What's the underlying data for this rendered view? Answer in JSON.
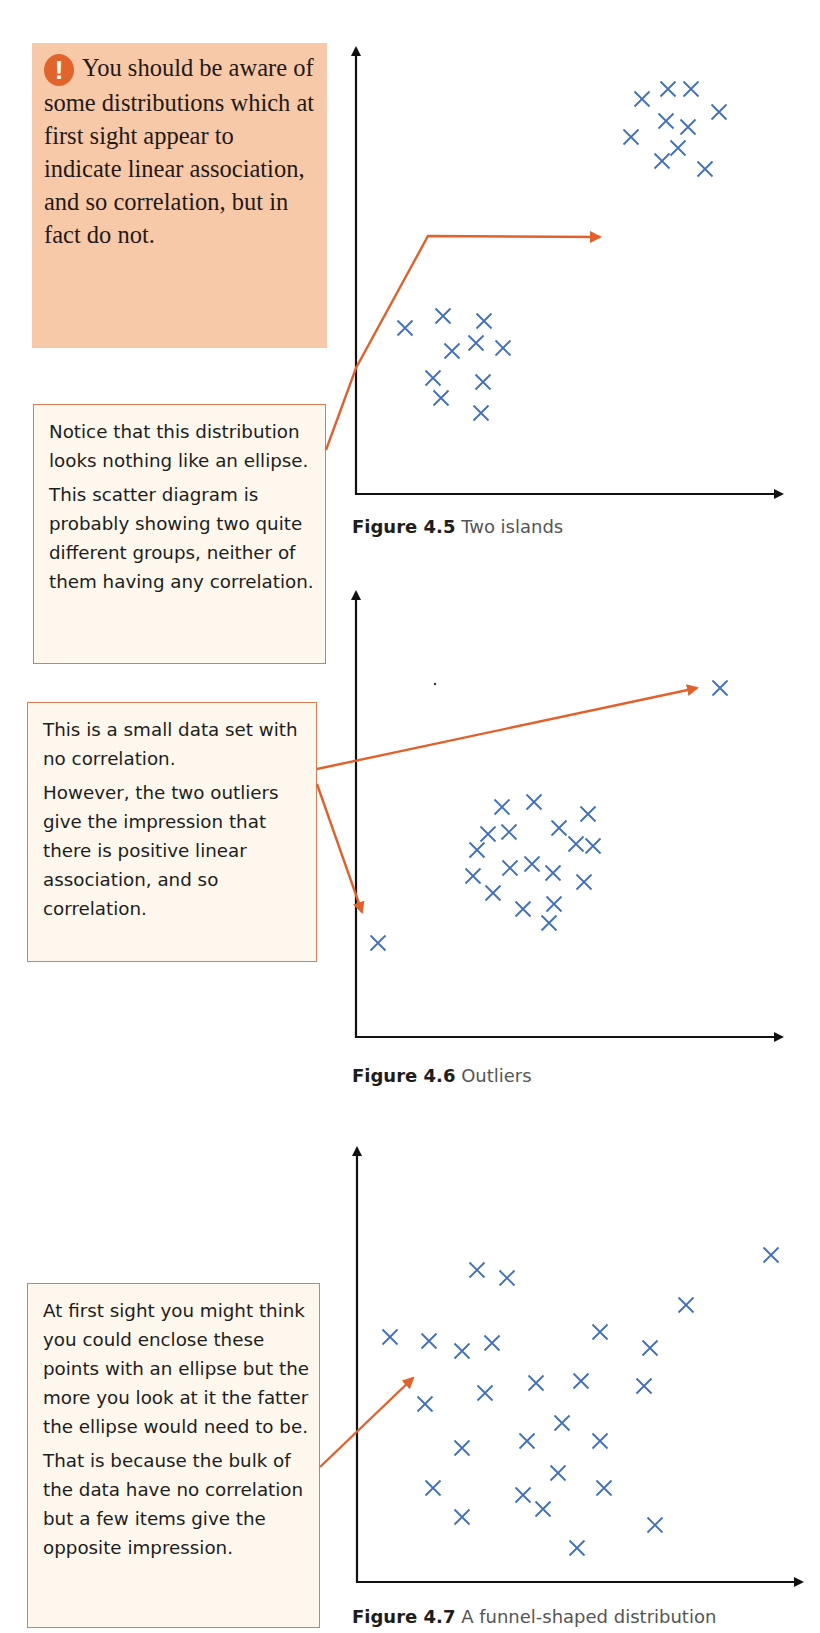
{
  "warning_box": {
    "icon": "exclamation-icon",
    "text": "You should be aware of some distributions which at first sight appear to indicate linear association, and so correlation, but in fact do not.",
    "colors": {
      "background": "#f8c9a8",
      "icon": "#e2642a"
    }
  },
  "notes": [
    {
      "paragraphs": [
        "Notice that this distribution looks nothing like an ellipse.",
        "This scatter diagram is probably showing two quite different groups, neither of them having any correlation."
      ]
    },
    {
      "paragraphs": [
        "This is a small data set with no correlation.",
        "However, the two outliers give the impression that there is positive linear association, and so correlation."
      ]
    },
    {
      "paragraphs": [
        "At first sight you might think you could enclose these points with an ellipse but the more you look at it the fatter the ellipse would need to be.",
        "That is because the bulk of the data have no correlation but a few items give the opposite impression."
      ]
    }
  ],
  "figures": [
    {
      "number": "Figure 4.5",
      "title": "Two islands"
    },
    {
      "number": "Figure 4.6",
      "title": "Outliers"
    },
    {
      "number": "Figure 4.7",
      "title": "A funnel-shaped distribution"
    }
  ],
  "colors": {
    "marker": "#3f6fc0",
    "arrow": "#e4602a",
    "axis": "#111111",
    "note_border": "#e07a4f",
    "note_bg": "#fdf7ee"
  },
  "chart_data": [
    {
      "type": "scatter",
      "title": "Figure 4.5 Two islands",
      "xlabel": "",
      "ylabel": "",
      "grid": false,
      "marker": "x",
      "series": [
        {
          "name": "lower cluster",
          "points": [
            [
              405,
              328
            ],
            [
              443,
              316
            ],
            [
              484,
              321
            ],
            [
              452,
              351
            ],
            [
              476,
              343
            ],
            [
              503,
              348
            ],
            [
              433,
              378
            ],
            [
              483,
              382
            ],
            [
              441,
              398
            ],
            [
              481,
              413
            ]
          ]
        },
        {
          "name": "upper cluster",
          "points": [
            [
              642,
              99
            ],
            [
              668,
              89
            ],
            [
              691,
              89
            ],
            [
              719,
              112
            ],
            [
              666,
              121
            ],
            [
              688,
              127
            ],
            [
              631,
              137
            ],
            [
              678,
              148
            ],
            [
              662,
              161
            ],
            [
              705,
              169
            ]
          ]
        }
      ],
      "note": "Point coordinates are pixel positions (no axis scale shown)."
    },
    {
      "type": "scatter",
      "title": "Figure 4.6 Outliers",
      "xlabel": "",
      "ylabel": "",
      "grid": false,
      "marker": "x",
      "series": [
        {
          "name": "main cluster",
          "points": [
            [
              502,
              807
            ],
            [
              534,
              802
            ],
            [
              588,
              814
            ],
            [
              488,
              834
            ],
            [
              509,
              832
            ],
            [
              559,
              828
            ],
            [
              477,
              850
            ],
            [
              576,
              844
            ],
            [
              593,
              846
            ],
            [
              473,
              876
            ],
            [
              510,
              868
            ],
            [
              532,
              864
            ],
            [
              553,
              873
            ],
            [
              584,
              882
            ],
            [
              493,
              893
            ],
            [
              523,
              909
            ],
            [
              554,
              904
            ],
            [
              549,
              923
            ]
          ]
        },
        {
          "name": "outliers",
          "points": [
            [
              720,
              688
            ],
            [
              378,
              943
            ]
          ]
        }
      ],
      "note": "Point coordinates are pixel positions (no axis scale shown)."
    },
    {
      "type": "scatter",
      "title": "Figure 4.7 A funnel-shaped distribution",
      "xlabel": "",
      "ylabel": "",
      "grid": false,
      "marker": "x",
      "series": [
        {
          "name": "points",
          "points": [
            [
              477,
              1270
            ],
            [
              507,
              1278
            ],
            [
              771,
              1255
            ],
            [
              390,
              1337
            ],
            [
              429,
              1341
            ],
            [
              462,
              1351
            ],
            [
              492,
              1343
            ],
            [
              600,
              1332
            ],
            [
              650,
              1348
            ],
            [
              686,
              1305
            ],
            [
              425,
              1404
            ],
            [
              485,
              1393
            ],
            [
              536,
              1383
            ],
            [
              581,
              1381
            ],
            [
              644,
              1386
            ],
            [
              562,
              1423
            ],
            [
              462,
              1448
            ],
            [
              527,
              1441
            ],
            [
              600,
              1441
            ],
            [
              558,
              1473
            ],
            [
              433,
              1488
            ],
            [
              523,
              1495
            ],
            [
              604,
              1488
            ],
            [
              543,
              1509
            ],
            [
              462,
              1517
            ],
            [
              655,
              1525
            ],
            [
              577,
              1548
            ]
          ]
        }
      ],
      "note": "Point coordinates are pixel positions (no axis scale shown)."
    }
  ]
}
